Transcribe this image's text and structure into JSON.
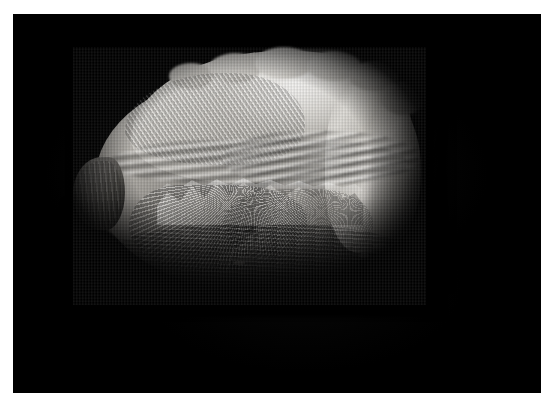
{
  "image": {
    "kind": "photograph",
    "subject": "napa-cabbage",
    "subject_label": "Napa cabbage (Chinese cabbage) head",
    "orientation": "horizontal, tapered end to the left",
    "background_label": "solid black studio backdrop",
    "border_label": "white page margin"
  },
  "canvas": {
    "width": 555,
    "height": 410,
    "background_color": "#ffffff"
  },
  "plate": {
    "x": 13,
    "y": 14,
    "width": 528,
    "height": 379,
    "background_color": "#000000"
  },
  "subject": {
    "x": 73,
    "y": 47,
    "width": 353,
    "height": 258,
    "parts": [
      {
        "name": "outer-leaf-crown",
        "label": "Ruffled pale outer leaves forming the crown"
      },
      {
        "name": "mid-rib-band",
        "label": "Long sweeping bundle of white midribs"
      },
      {
        "name": "torn-leaf",
        "label": "Torn pale leaf lying across the centre"
      },
      {
        "name": "vein-fan",
        "label": "Fan of radiating leaf veins on the lower left face"
      },
      {
        "name": "right-leaf-tips",
        "label": "Crumpled leaf tips at the right end"
      },
      {
        "name": "stem-nub",
        "label": "Cut stem / root nub at the left end"
      },
      {
        "name": "lower-shadow",
        "label": "Deep shadow across the bottom of the head"
      }
    ]
  },
  "palette": {
    "background": "#000000",
    "page": "#ffffff",
    "highlight": "#f0efec",
    "leaf_light": "#d8d6d2",
    "leaf_mid": "#a7a39d",
    "leaf_dark": "#434240",
    "shadow": "#060606"
  }
}
